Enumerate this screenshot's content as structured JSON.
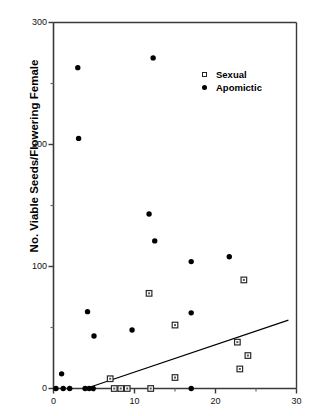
{
  "chart_data": {
    "type": "scatter",
    "title": "",
    "xlabel": "",
    "ylabel": "No. Viable Seeds/Flowering Female",
    "xlim": [
      0,
      30
    ],
    "ylim": [
      0,
      300
    ],
    "x_ticks": [
      0,
      10,
      20,
      30
    ],
    "x_tick_labels": [
      "0",
      "10",
      "20",
      "30"
    ],
    "y_ticks": [
      0,
      100,
      200,
      300
    ],
    "y_tick_labels": [
      "0",
      "100",
      "200",
      "300"
    ],
    "y_minor_ticks": [
      50,
      150,
      250
    ],
    "grid": false,
    "legend_position": "upper-right-inside",
    "series": [
      {
        "name": "Sexual",
        "marker": "open-square",
        "color": "#000000",
        "points": [
          [
            7.0,
            8
          ],
          [
            7.5,
            0
          ],
          [
            8.3,
            0
          ],
          [
            9.1,
            0
          ],
          [
            12.0,
            0
          ],
          [
            11.8,
            78
          ],
          [
            15.0,
            9
          ],
          [
            15.0,
            52
          ],
          [
            22.7,
            38
          ],
          [
            23.0,
            16
          ],
          [
            23.5,
            89
          ],
          [
            24.0,
            27
          ]
        ]
      },
      {
        "name": "Apomictic",
        "marker": "filled-circle",
        "color": "#000000",
        "points": [
          [
            0.3,
            0
          ],
          [
            1.0,
            12
          ],
          [
            1.2,
            0
          ],
          [
            2.0,
            0
          ],
          [
            3.0,
            263
          ],
          [
            3.1,
            205
          ],
          [
            3.9,
            0
          ],
          [
            4.2,
            63
          ],
          [
            4.4,
            0
          ],
          [
            4.9,
            0
          ],
          [
            5.0,
            43
          ],
          [
            9.7,
            48
          ],
          [
            11.8,
            143
          ],
          [
            12.3,
            271
          ],
          [
            12.5,
            121
          ],
          [
            17.0,
            0
          ],
          [
            17.0,
            62
          ],
          [
            17.0,
            104
          ],
          [
            21.7,
            108
          ]
        ]
      }
    ],
    "trendline": {
      "name": "regression-line",
      "x_start": 4.0,
      "y_start": 0,
      "x_end": 29.0,
      "y_end": 56
    }
  },
  "legend": {
    "items": [
      {
        "label": "Sexual",
        "symbol": "open-square"
      },
      {
        "label": "Apomictic",
        "symbol": "filled-circle"
      }
    ]
  },
  "axes": {
    "y_title": "No. Viable Seeds/Flowering Female"
  }
}
